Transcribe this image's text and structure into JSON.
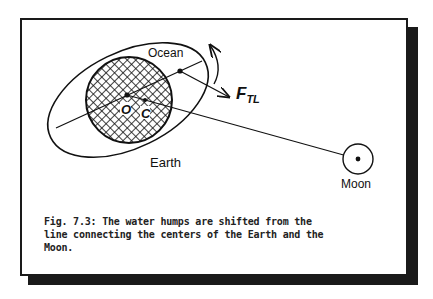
{
  "figure": {
    "labels": {
      "ocean": "Ocean",
      "earth": "Earth",
      "moon": "Moon",
      "force_main": "F",
      "force_sub": "TL",
      "point_o": "O",
      "point_c": "C"
    },
    "caption": {
      "lines": [
        "Fig. 7.3: The water humps are shifted from the",
        "line connecting the centers of the Earth and the",
        "Moon."
      ]
    },
    "colors": {
      "ink": "#111111",
      "background": "#ffffff",
      "shadow": "#1a1a1a"
    }
  }
}
